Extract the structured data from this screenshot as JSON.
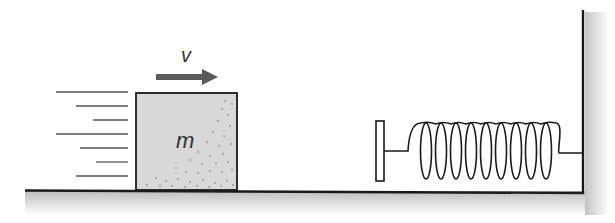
{
  "diagram": {
    "labels": {
      "velocity": "v",
      "mass": "m"
    },
    "colors": {
      "ground_shade": "#c8c8c8",
      "block_fill": "#d6d6d6",
      "arrow": "#5a5a5a",
      "outline": "#1a1a1a",
      "background": "#ffffff"
    },
    "elements": [
      {
        "name": "ground-surface",
        "type": "line"
      },
      {
        "name": "wall",
        "type": "line"
      },
      {
        "name": "block",
        "type": "rect",
        "label": "m"
      },
      {
        "name": "velocity-arrow",
        "type": "arrow",
        "label": "v",
        "direction": "right"
      },
      {
        "name": "motion-lines",
        "type": "lines",
        "count": 7
      },
      {
        "name": "bumper-plate",
        "type": "rect"
      },
      {
        "name": "spring",
        "type": "coil",
        "coils": 10
      }
    ]
  }
}
